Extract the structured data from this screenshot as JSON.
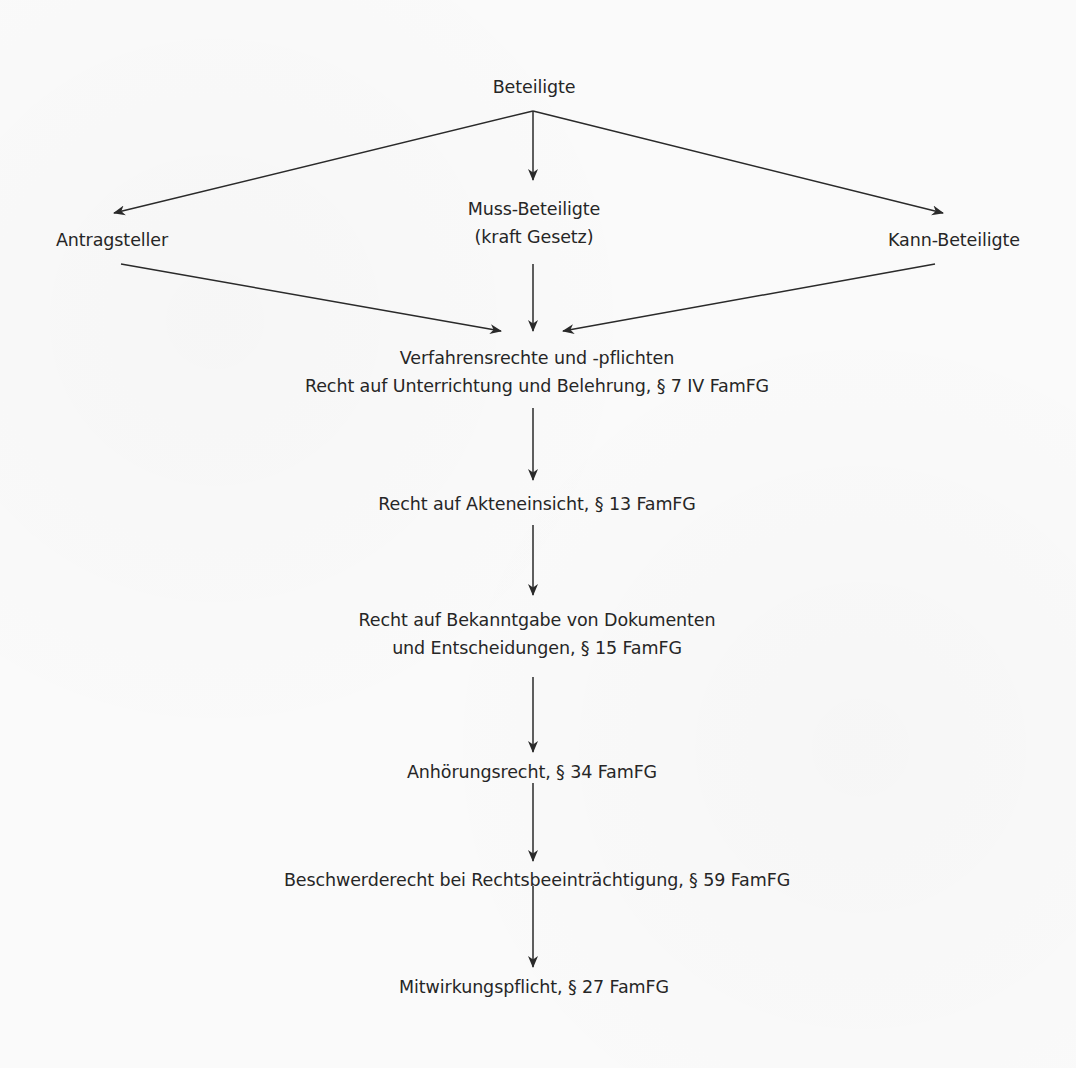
{
  "diagram": {
    "type": "flowchart",
    "colors": {
      "background": "#fafafa",
      "text": "#262626",
      "line": "#2a2a2a"
    },
    "root": {
      "label": "Beteiligte"
    },
    "participants": [
      {
        "id": "antragsteller",
        "label": "Antragsteller"
      },
      {
        "id": "muss",
        "lines": [
          "Muss-Beteiligte",
          "(kraft Gesetz)"
        ]
      },
      {
        "id": "kann",
        "label": "Kann-Beteiligte"
      }
    ],
    "rights_header": {
      "lines": [
        "Verfahrensrechte und -pflichten",
        "Recht auf Unterrichtung und Belehrung, § 7 IV FamFG"
      ]
    },
    "steps": [
      {
        "lines": [
          "Recht auf Akteneinsicht, § 13 FamFG"
        ]
      },
      {
        "lines": [
          "Recht auf Bekanntgabe von Dokumenten",
          "und Entscheidungen, § 15 FamFG"
        ]
      },
      {
        "lines": [
          "Anhörungsrecht, § 34 FamFG"
        ]
      },
      {
        "lines": [
          "Beschwerderecht bei Rechtsbeeinträchtigung, § 59 FamFG"
        ]
      },
      {
        "lines": [
          "Mitwirkungspflicht, § 27 FamFG"
        ]
      }
    ],
    "edges": [
      {
        "from": "Beteiligte",
        "to": "Antragsteller"
      },
      {
        "from": "Beteiligte",
        "to": "Muss-Beteiligte"
      },
      {
        "from": "Beteiligte",
        "to": "Kann-Beteiligte"
      },
      {
        "from": "Antragsteller",
        "to": "Verfahrensrechte und -pflichten"
      },
      {
        "from": "Muss-Beteiligte",
        "to": "Verfahrensrechte und -pflichten"
      },
      {
        "from": "Kann-Beteiligte",
        "to": "Verfahrensrechte und -pflichten"
      },
      {
        "from": "Verfahrensrechte und -pflichten",
        "to": "Recht auf Akteneinsicht"
      },
      {
        "from": "Recht auf Akteneinsicht",
        "to": "Recht auf Bekanntgabe"
      },
      {
        "from": "Recht auf Bekanntgabe",
        "to": "Anhörungsrecht"
      },
      {
        "from": "Anhörungsrecht",
        "to": "Beschwerderecht"
      },
      {
        "from": "Beschwerderecht",
        "to": "Mitwirkungspflicht"
      }
    ]
  }
}
